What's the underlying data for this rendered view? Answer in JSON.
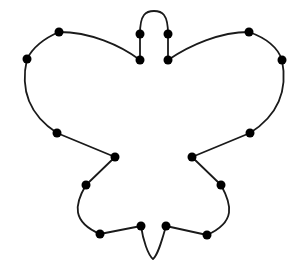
{
  "figure": {
    "stroke_color": "#1a1a1a",
    "dot_color": "#000000",
    "background": "#ffffff",
    "dot_radius": 4.5
  },
  "outline_path": "M140,60 L140,34 C140,14 146,11 154,11 C162,11 168,14 168,34 L168,60 C190,45 220,32 249,32 C266,38 278,48 282,60 C287,85 283,112 250,133 L192,157 L221,185 C232,205 236,222 207,235 L166,226 C162,240 158,255 153,259 C148,255 143,240 141,226 L100,234 C72,222 74,205 86,185 L115,157 L57,133 C25,112 21,85 27,59 C33,47 45,38 59,32 C90,32 120,45 140,60 Z",
  "dots": [
    {
      "x": 140,
      "y": 34
    },
    {
      "x": 168,
      "y": 34
    },
    {
      "x": 140,
      "y": 60
    },
    {
      "x": 168,
      "y": 60
    },
    {
      "x": 59,
      "y": 32
    },
    {
      "x": 249,
      "y": 32
    },
    {
      "x": 27,
      "y": 59
    },
    {
      "x": 282,
      "y": 60
    },
    {
      "x": 57,
      "y": 133
    },
    {
      "x": 250,
      "y": 133
    },
    {
      "x": 115,
      "y": 157
    },
    {
      "x": 192,
      "y": 157
    },
    {
      "x": 86,
      "y": 185
    },
    {
      "x": 221,
      "y": 185
    },
    {
      "x": 100,
      "y": 234
    },
    {
      "x": 207,
      "y": 235
    },
    {
      "x": 141,
      "y": 226
    },
    {
      "x": 166,
      "y": 226
    }
  ]
}
